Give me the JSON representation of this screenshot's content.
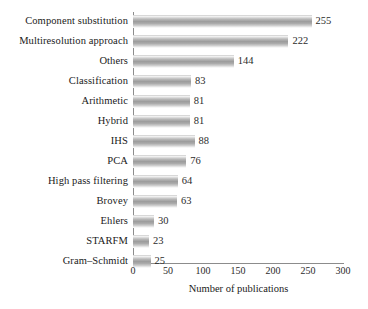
{
  "chart_data": {
    "type": "bar",
    "orientation": "horizontal",
    "title": "",
    "xlabel": "Number of publications",
    "ylabel": "",
    "categories": [
      "Component substitution",
      "Multiresolution approach",
      "Others",
      "Classification",
      "Arithmetic",
      "Hybrid",
      "IHS",
      "PCA",
      "High pass filtering",
      "Brovey",
      "Ehlers",
      "STARFM",
      "Gram–Schmidt"
    ],
    "values": [
      255,
      222,
      144,
      83,
      81,
      81,
      88,
      76,
      64,
      63,
      30,
      23,
      25
    ],
    "value_labels": [
      "255",
      "222",
      "144",
      "83",
      "81",
      "81",
      "88",
      "76",
      "64",
      "63",
      "30",
      "23",
      "25"
    ],
    "xlim": [
      0,
      300
    ],
    "xticks": [
      0,
      50,
      100,
      150,
      200,
      250,
      300
    ],
    "xtick_labels": [
      "0",
      "50",
      "100",
      "150",
      "200",
      "250",
      "300"
    ],
    "grid": false,
    "legend": null,
    "bar_color": "#a6a6a6",
    "axis_color": "#8c8c8c",
    "background": "#ffffff"
  }
}
